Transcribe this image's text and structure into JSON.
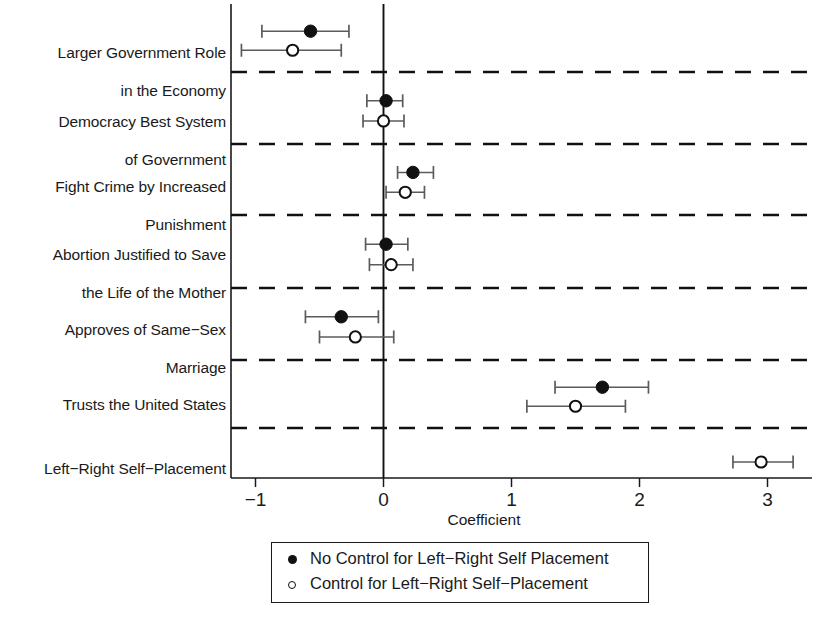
{
  "chart_data": {
    "type": "scatter",
    "title": "",
    "xlabel": "Coefficient",
    "ylabel": "",
    "xlim": [
      -1.18,
      3.33
    ],
    "xticks": [
      -1,
      0,
      1,
      2,
      3
    ],
    "xticklabels": [
      "−1",
      "0",
      "1",
      "2",
      "3"
    ],
    "grid": false,
    "zero_reference_line": 0,
    "row_separators": "dashed",
    "legend_position": "below-axis",
    "categories": [
      "Larger Government Role\nin the Economy",
      "Democracy Best System\nof Government",
      "Fight Crime by Increased\nPunishment",
      "Abortion Justified to Save\nthe Life of the Mother",
      "Approves of Same−Sex\nMarriage",
      "Trusts the United States",
      "Left−Right Self−Placement"
    ],
    "series": [
      {
        "name": "No Control for Left−Right Self Placement",
        "marker": "filled-circle",
        "points": [
          {
            "category": "Larger Government Role in the Economy",
            "estimate": -0.57,
            "ci_low": -0.95,
            "ci_high": -0.27
          },
          {
            "category": "Democracy Best System of Government",
            "estimate": 0.02,
            "ci_low": -0.13,
            "ci_high": 0.15
          },
          {
            "category": "Fight Crime by Increased Punishment",
            "estimate": 0.23,
            "ci_low": 0.11,
            "ci_high": 0.39
          },
          {
            "category": "Abortion Justified to Save the Life of the Mother",
            "estimate": 0.02,
            "ci_low": -0.14,
            "ci_high": 0.19
          },
          {
            "category": "Approves of Same−Sex Marriage",
            "estimate": -0.33,
            "ci_low": -0.61,
            "ci_high": -0.04
          },
          {
            "category": "Trusts the United States",
            "estimate": 1.71,
            "ci_low": 1.34,
            "ci_high": 2.07
          },
          {
            "category": "Left−Right Self−Placement",
            "estimate": null,
            "ci_low": null,
            "ci_high": null
          }
        ]
      },
      {
        "name": "Control for Left−Right Self−Placement",
        "marker": "open-circle",
        "points": [
          {
            "category": "Larger Government Role in the Economy",
            "estimate": -0.71,
            "ci_low": -1.11,
            "ci_high": -0.33
          },
          {
            "category": "Democracy Best System of Government",
            "estimate": 0.0,
            "ci_low": -0.16,
            "ci_high": 0.16
          },
          {
            "category": "Fight Crime by Increased Punishment",
            "estimate": 0.17,
            "ci_low": 0.02,
            "ci_high": 0.32
          },
          {
            "category": "Abortion Justified to Save the Life of the Mother",
            "estimate": 0.06,
            "ci_low": -0.11,
            "ci_high": 0.23
          },
          {
            "category": "Approves of Same−Sex Marriage",
            "estimate": -0.22,
            "ci_low": -0.5,
            "ci_high": 0.08
          },
          {
            "category": "Trusts the United States",
            "estimate": 1.5,
            "ci_low": 1.12,
            "ci_high": 1.89
          },
          {
            "category": "Left−Right Self−Placement",
            "estimate": 2.95,
            "ci_low": 2.73,
            "ci_high": 3.2
          }
        ]
      }
    ],
    "colors": {
      "marker_filled": "#111111",
      "marker_open_fill": "#ffffff",
      "marker_stroke": "#111111",
      "error_bar": "#5b5b5b",
      "axis": "#1a1a1a",
      "separator": "#111111",
      "zero_line": "#111111",
      "background": "#ffffff"
    }
  },
  "legend": {
    "items": [
      {
        "marker": "filled-circle-icon",
        "label": "No Control for Left−Right Self Placement"
      },
      {
        "marker": "open-circle-icon",
        "label": "Control for Left−Right Self−Placement"
      }
    ]
  },
  "axis": {
    "title": "Coefficient",
    "ticklabels": [
      "−1",
      "0",
      "1",
      "2",
      "3"
    ]
  },
  "categories": [
    {
      "line1": "Larger Government Role",
      "line2": "in the Economy"
    },
    {
      "line1": "Democracy Best System",
      "line2": "of Government"
    },
    {
      "line1": "Fight Crime by Increased",
      "line2": "Punishment"
    },
    {
      "line1": "Abortion Justified to Save",
      "line2": "the Life of the Mother"
    },
    {
      "line1": "Approves of Same−Sex",
      "line2": "Marriage"
    },
    {
      "line1": "Trusts the United States",
      "line2": ""
    },
    {
      "line1": "Left−Right Self−Placement",
      "line2": ""
    }
  ]
}
